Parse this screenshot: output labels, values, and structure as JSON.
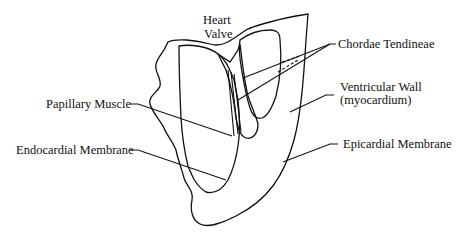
{
  "diagram": {
    "type": "anatomical-cross-section",
    "colors": {
      "background": "#ffffff",
      "ink": "#111111",
      "hatch": "#111111"
    },
    "labels": {
      "heart_valve_line1": "Heart",
      "heart_valve_line2": "Valve",
      "chordae_tendineae": "Chordae Tendineae",
      "papillary_muscle": "Papillary Muscle",
      "ventricular_wall_line1": "Ventricular Wall",
      "ventricular_wall_line2": "(myocardium)",
      "endocardial_membrane": "Endocardial Membrane",
      "epicardial_membrane": "Epicardial Membrane"
    },
    "parts": [
      "Heart Valve",
      "Chordae Tendineae",
      "Papillary Muscle",
      "Ventricular Wall (myocardium)",
      "Endocardial Membrane",
      "Epicardial Membrane"
    ]
  }
}
